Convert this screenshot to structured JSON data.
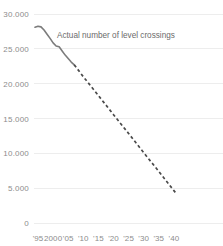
{
  "chart_data": {
    "type": "line",
    "title": "",
    "subtitle": "",
    "xlabel": "",
    "ylabel": "",
    "xlim": [
      1993,
      2042
    ],
    "ylim": [
      0,
      30000
    ],
    "grid": true,
    "legend_position": "none",
    "y_ticks": [
      0,
      5000,
      10000,
      15000,
      20000,
      25000,
      30000
    ],
    "y_tick_labels": [
      "0",
      "5.000",
      "10.000",
      "15.000",
      "20.000",
      "25.000",
      "30.000"
    ],
    "x_ticks": [
      1995,
      2000,
      2005,
      2010,
      2015,
      2020,
      2025,
      2030,
      2035,
      2040
    ],
    "x_tick_labels": [
      "'95",
      "2000",
      "'05",
      "'10",
      "'15",
      "'20",
      "'25",
      "'30",
      "'35",
      "'40"
    ],
    "annotations": [
      {
        "text": "Actual number of level crossings",
        "x": 2001.3,
        "y": 27000
      }
    ],
    "series": [
      {
        "name": "Actual number of level crossings",
        "style": "solid",
        "color": "#7c7c7c",
        "x": [
          1994,
          1995,
          1996,
          1997,
          1998,
          1999,
          2000,
          2001,
          2002,
          2003,
          2004,
          2005,
          2006,
          2007
        ],
        "values": [
          28100,
          28250,
          28150,
          27700,
          27100,
          26500,
          25850,
          25400,
          25300,
          24700,
          24100,
          23600,
          23100,
          22700
        ]
      },
      {
        "name": "Projected number of level crossings",
        "style": "dashed",
        "color": "#4a4a4a",
        "x": [
          2007,
          2010,
          2015,
          2020,
          2025,
          2030,
          2035,
          2040,
          2041
        ],
        "values": [
          22700,
          21000,
          18300,
          15550,
          12850,
          10100,
          7400,
          4650,
          4100
        ]
      }
    ]
  }
}
